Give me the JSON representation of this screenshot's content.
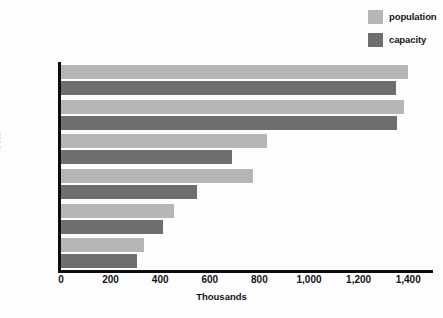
{
  "chart_data": {
    "type": "bar",
    "orientation": "horizontal",
    "title": "",
    "xlabel": "Thousands",
    "ylabel": "Year",
    "categories": [
      "2010",
      "2000",
      "1995",
      "1990",
      "1985",
      "1980"
    ],
    "series": [
      {
        "name": "population",
        "color": "#b5b5b5",
        "values": [
          1400,
          1385,
          830,
          775,
          455,
          335
        ]
      },
      {
        "name": "capacity",
        "color": "#6e6e6e",
        "values": [
          1350,
          1355,
          690,
          550,
          410,
          305
        ]
      }
    ],
    "xlim": [
      0,
      1500
    ],
    "xticks": [
      0,
      200,
      400,
      600,
      800,
      1000,
      1200,
      1400
    ],
    "xtick_labels": [
      "0",
      "200",
      "400",
      "600",
      "800",
      "1,000",
      "1,200",
      "1,400"
    ],
    "grid": false,
    "legend_position": "top-right"
  },
  "legend": {
    "entries": [
      {
        "label": "population",
        "color": "#b5b5b5"
      },
      {
        "label": "capacity",
        "color": "#6e6e6e"
      }
    ]
  },
  "axes": {
    "y_title": "Year",
    "x_title": "Thousands"
  }
}
